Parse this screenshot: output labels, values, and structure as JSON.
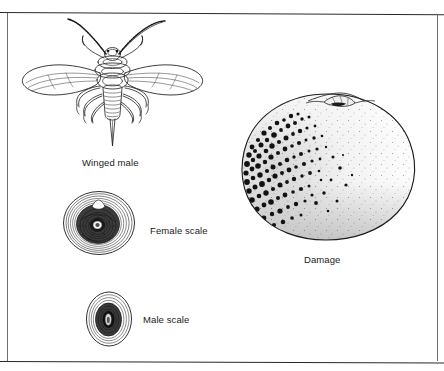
{
  "plate": {
    "type": "scientific-illustration-plate",
    "subject": "armored scale insect life stages and citrus fruit damage",
    "background_color": "#ffffff",
    "ink_color": "#1a1a1a",
    "border_color": "#2a2a2a"
  },
  "figures": [
    {
      "id": "winged-male",
      "caption": "Winged male",
      "description": "dorsal view of a winged male scale insect with two long antennae, two pairs of membranous veined wings, six legs and a segmented abdomen ending in a long style",
      "caption_position": "below"
    },
    {
      "id": "female-scale",
      "caption": "Female scale",
      "description": "circular armored female scale cover with concentric growth rings and a dark textured central exuvial cap",
      "caption_position": "right"
    },
    {
      "id": "male-scale",
      "caption": "Male scale",
      "description": "small elongate oval male scale cover with concentric rings and an elongated dark center",
      "caption_position": "right"
    },
    {
      "id": "damage",
      "caption": "Damage",
      "description": "citrus fruit with stem and calyx at top, heavily encrusted with dark scale insects concentrated on the left side, thinning toward the right",
      "caption_position": "below"
    }
  ],
  "captions": {
    "winged_male": "Winged male",
    "female_scale": "Female scale",
    "male_scale": "Male scale",
    "damage": "Damage"
  }
}
